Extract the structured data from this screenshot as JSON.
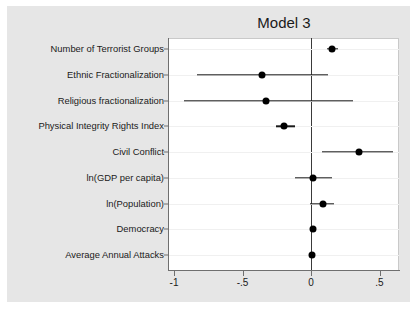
{
  "chart_data": {
    "type": "scatter",
    "title": "Model 3",
    "xlabel": "",
    "ylabel": "",
    "xlim": [
      -1.12,
      0.66
    ],
    "xticks": [
      -1,
      -0.5,
      0,
      0.5
    ],
    "xticklabels": [
      "-1",
      "-.5",
      "0",
      ".5"
    ],
    "grid": false,
    "legend": null,
    "reference_line": 0,
    "orientation": "horizontal",
    "categories": [
      "Number of Terrorist Groups",
      "Ethnic Fractionalization",
      "Religious fractionalization",
      "Physical Integrity Rights Index",
      "Civil Conflict",
      "ln(GDP per capita)",
      "ln(Population)",
      "Democracy",
      "Average Annual Attacks"
    ],
    "values": [
      0.155,
      -0.355,
      -0.325,
      -0.195,
      0.35,
      0.015,
      0.085,
      0.015,
      0.005
    ],
    "ci_low": [
      0.115,
      -0.835,
      -0.925,
      -0.255,
      0.08,
      -0.115,
      -0.01,
      0.0,
      0.0
    ],
    "ci_high": [
      0.195,
      0.125,
      0.305,
      -0.115,
      0.6,
      0.15,
      0.17,
      0.03,
      0.015
    ],
    "points": [
      {
        "label": "Number of Terrorist Groups",
        "estimate": 0.155,
        "ci_low": 0.115,
        "ci_high": 0.195
      },
      {
        "label": "Ethnic Fractionalization",
        "estimate": -0.355,
        "ci_low": -0.835,
        "ci_high": 0.125
      },
      {
        "label": "Religious fractionalization",
        "estimate": -0.325,
        "ci_low": -0.925,
        "ci_high": 0.305
      },
      {
        "label": "Physical Integrity Rights Index",
        "estimate": -0.195,
        "ci_low": -0.255,
        "ci_high": -0.115
      },
      {
        "label": "Civil Conflict",
        "estimate": 0.35,
        "ci_low": 0.08,
        "ci_high": 0.6
      },
      {
        "label": "ln(GDP per capita)",
        "estimate": 0.015,
        "ci_low": -0.115,
        "ci_high": 0.15
      },
      {
        "label": "ln(Population)",
        "estimate": 0.085,
        "ci_low": -0.01,
        "ci_high": 0.17
      },
      {
        "label": "Democracy",
        "estimate": 0.015,
        "ci_low": 0.0,
        "ci_high": 0.03
      },
      {
        "label": "Average Annual Attacks",
        "estimate": 0.005,
        "ci_low": 0.0,
        "ci_high": 0.015
      }
    ]
  },
  "colors": {
    "figure_background": "#ffffff",
    "graph_background": "#e6e6e6",
    "plot_background": "#ffffff",
    "marker": "#000000",
    "ci_line": "#1a1a1a",
    "axis": "#6f6f6f",
    "zero_line": "#3a3a3a",
    "text": "#1a1a1a"
  }
}
